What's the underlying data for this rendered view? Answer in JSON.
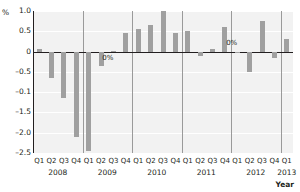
{
  "chart_data": {
    "type": "bar",
    "title": "",
    "subtitle": "",
    "xlabel": "Year",
    "ylabel": "%",
    "ylim": [
      -2.5,
      1.0
    ],
    "yticks": [
      1.0,
      0.5,
      0,
      -0.5,
      -0.1,
      -1.5,
      -2.0,
      -2.5
    ],
    "ytick_labels": [
      "1.0",
      "0.5",
      "0",
      "–0.5",
      "–0.1",
      "–1.5",
      "–2.0",
      "–2.5"
    ],
    "grid": true,
    "legend": "none",
    "bar_color": "#a0a0a0",
    "zero_line_color": "#231f20",
    "plot_bg_color": "#f2f2f2",
    "categories": [
      "Q1",
      "Q2",
      "Q3",
      "Q4",
      "Q1",
      "Q2",
      "Q3",
      "Q4",
      "Q1",
      "Q2",
      "Q3",
      "Q4",
      "Q1",
      "Q2",
      "Q3",
      "Q4",
      "Q1",
      "Q2",
      "Q3",
      "Q4",
      "Q1"
    ],
    "values": [
      0.07,
      -0.65,
      -1.15,
      -2.1,
      -2.45,
      -0.35,
      0.02,
      0.45,
      0.55,
      0.65,
      1.0,
      0.45,
      0.5,
      -0.1,
      0.07,
      0.6,
      -0.02,
      -0.5,
      0.75,
      -0.15,
      0.3
    ],
    "year_groups": [
      {
        "year": "2008",
        "quarters": [
          "Q1",
          "Q2",
          "Q3",
          "Q4"
        ]
      },
      {
        "year": "2009",
        "quarters": [
          "Q1",
          "Q2",
          "Q3",
          "Q4"
        ]
      },
      {
        "year": "2010",
        "quarters": [
          "Q1",
          "Q2",
          "Q3",
          "Q4"
        ]
      },
      {
        "year": "2011",
        "quarters": [
          "Q1",
          "Q2",
          "Q3",
          "Q4"
        ]
      },
      {
        "year": "2012",
        "quarters": [
          "Q1",
          "Q2",
          "Q3",
          "Q4"
        ]
      },
      {
        "year": "2013",
        "quarters": [
          "Q1"
        ]
      }
    ],
    "annotations": [
      {
        "text": "0%",
        "x_index": 5.6,
        "value": -0.16
      },
      {
        "text": "0%",
        "x_index": 15.6,
        "value": 0.22
      }
    ]
  },
  "axis": {
    "unit_label": "%",
    "x_title": "Year"
  }
}
